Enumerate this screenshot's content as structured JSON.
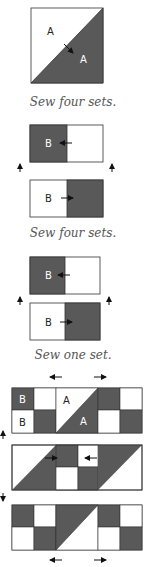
{
  "colors": {
    "dark": "#595959",
    "light": "#ffffff",
    "stroke": "#333333",
    "label_on_dark": "#ffffff",
    "label_on_light": "#222222"
  },
  "step1": {
    "labels": [
      "A",
      "A"
    ],
    "caption": "Sew four sets."
  },
  "step2": {
    "labels": [
      "B",
      "B"
    ],
    "caption": "Sew four sets."
  },
  "step3": {
    "labels": [
      "B",
      "B"
    ],
    "caption": "Sew one set."
  },
  "step4": {
    "labels": [
      "B",
      "B",
      "A",
      "A"
    ]
  }
}
